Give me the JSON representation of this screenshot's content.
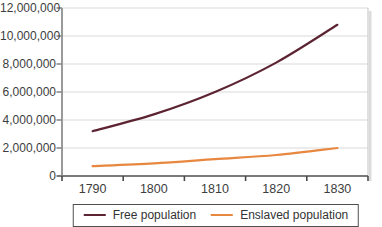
{
  "chart_data": {
    "type": "line",
    "x": [
      "1790",
      "1800",
      "1810",
      "1820",
      "1830"
    ],
    "series": [
      {
        "name": "Free population",
        "color": "#5c2433",
        "values": [
          3200000,
          4400000,
          6000000,
          8100000,
          10800000
        ]
      },
      {
        "name": "Enslaved population",
        "color": "#e8873f",
        "values": [
          700000,
          900000,
          1200000,
          1500000,
          2000000
        ]
      }
    ],
    "ylim": [
      0,
      12000000
    ],
    "ytick_step": 2000000,
    "ytick_labels": [
      "0",
      "2,000,000",
      "4,000,000",
      "6,000,000",
      "8,000,000",
      "10,000,000",
      "12,000,000"
    ],
    "grid": "horizontal",
    "legend_position": "bottom"
  },
  "colors": {
    "gridline": "#d9d9d9",
    "plot_right_border": "#cccccc",
    "y_axis": "#8f8f8f",
    "x_axis": "#7a7a7a",
    "tick": "#4a4a4a",
    "tick_text": "#3d3d3d",
    "legend_border": "#4f4f4f",
    "background": "#ffffff",
    "shadow": "#d6d6d6"
  }
}
